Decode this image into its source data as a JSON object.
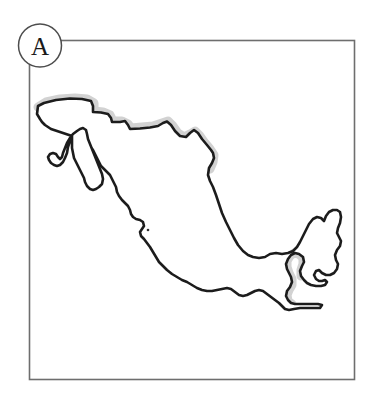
{
  "figure": {
    "panel_label": "A",
    "background_color": "#ffffff"
  },
  "frame": {
    "name": "panel-border-rectangle",
    "x": 29.5,
    "y": 40.5,
    "width": 325,
    "height": 339,
    "stroke_color": "#6e6e6e",
    "stroke_width": 1.6,
    "fill": "none"
  },
  "panel_label_badge": {
    "letter": "A",
    "center_x": 40,
    "center_y": 45.5,
    "radius": 21.5,
    "stroke_color": "#4d4d4d",
    "stroke_width": 1.5,
    "fill": "#ffffff",
    "text_color": "#1a1a1a"
  },
  "map": {
    "outline_color": "#1c1c1c",
    "outline_width": 2.6,
    "fill": "#ffffff",
    "highlight_color": "#d2d2d2",
    "highlight_width": 9,
    "country_outline_path": "M 37 114 L 38 106 L 47 103 L 60 100 L 74 99 L 86 100 L 94 104 L 94 112 L 101 113 L 106 114 L 110 116 L 112 122 L 119 122 L 124 121 L 127 124 L 129 129 L 136 129 L 145 128 L 152 127 L 159 126 L 164 123 L 168 122 L 172 126 L 176 132 L 180 136 L 186 137 L 190 134 L 193 130 L 197 131 L 200 136 L 204 141 L 209 147 L 213 150 L 206 156 L 203 163 L 203 171 L 206 176 L 209 179 L 211 185 L 213 189 L 216 185 L 218 179 L 217 172 L 214 167 L 214 160 L 217 155 L 220 147 L 220 139 L 219 133 L 222 129 L 227 127 L 232 128 L 237 128 L 241 128 L 245 128 L 245 126 L 240 125 L 234 125 L 229 124 L 226 126 L 222 126 L 219 129 L 214 134 L 210 139 L 207 143",
    "mainland_path": "M 37 114 L 38 106 L 44 103 L 56 100 L 70 98.5 L 82 99 L 91 101 L 93 106 L 93 112 L 101 112.5 L 108 114 L 111 118 L 112 122 L 120 122 L 125 121 L 128 125 L 130 129 L 140 128.5 L 150 127.5 L 158 126 L 163 123 L 167 121.5 L 171 125 L 175 131 L 180 136 L 186 137 L 190 133 L 194 130 L 198 133 L 202 139 L 207 145 L 211 150 L 213 153 L 214 158 L 212 163 L 209 168 L 208 175 L 210 181 L 213 187 L 216 195 L 219 204 L 222 213 L 226 222 L 230 230 L 234 238 L 238 245 L 243 251 L 248 255 L 253 257 L 259 258 L 265 257 L 270 254 L 276 253 L 282 254 L 288 253 L 293 251 L 297 247 L 300 242 L 303 236 L 306 230 L 309 224 L 313 219 L 317 217 L 321 218 L 324 221 L 326 216 L 329 212 L 333 210 L 337 210 L 340 212 L 341 217 L 340 223 L 338 228 L 337 233 L 339 237 L 341 241 L 340 246 L 337 250 L 335 255 L 336 260 L 338 264 L 337 269 L 334 273 L 330 275 L 326 275 L 322 273 L 319 270 L 316 271 L 314 275 L 316 279 L 319 281 L 322 281 L 325 280 L 327 282 L 325 285 L 321 286 L 316 286 L 311 285 L 307 283 L 304 280 L 301 276 L 300 271 L 302 266 L 304 262 L 303 257 L 299 254 L 295 253 L 291 255 L 288 259 L 286 264 L 287 269 L 289 273 L 291 277 L 292 282 L 290 287 L 287 291 L 286 296 L 288 300 L 291 303 L 295 304 L 300 304 L 306 304 L 312 304 L 318 304 L 322 305 L 320 308 L 314 308 L 307 308 L 300 308 L 294 309 L 289 310 L 285 309 L 282 306 L 279 303 L 275 300 L 271 297 L 267 294 L 263 291 L 259 290 L 255 291 L 251 293 L 247 295 L 243 296 L 239 295 L 235 292 L 231 289 L 227 288 L 222 289 L 217 290 L 212 291 L 207 291 L 202 290 L 197 288 L 192 285 L 187 282 L 182 280 L 177 277 L 172 274 L 167 270 L 163 266 L 159 262 L 156 257 L 153 252 L 150 247 L 147 243 L 144 239 L 141 236 L 140 232 L 142 229 L 144 226 L 143 222 L 140 220 L 136 219 L 133 217 L 131 214 L 130 210 L 128 206 L 125 203 L 122 200 L 119 196 L 117 192 L 116 187 L 114 183 L 112 179 L 110 175 L 107 172 L 104 169 L 101 166 L 99 162 L 97 158 L 95 154 L 93 150 L 90 147 L 87 145 L 84 143 L 81 141 L 78 139 L 75 137 L 72 136 L 69 135 L 66 134 L 63 133 L 60 132 L 57 131 L 54 130 L 51 129 L 48 127 L 45 125 L 42 122 L 40 119 Z",
    "baja_path": "M 72 136 L 70 141 L 68 147 L 67 153 L 65 158 L 63 162 L 60 165 L 57 166 L 54 165 L 51 163 L 49 160 L 48 157 L 50 154 L 53 153 L 56 154 L 58 157 L 60 159 L 62 157 L 63 153 L 65 148 L 67 143 L 70 138 L 73 134 L 77 131 L 80 129 L 83 128 L 86 130 L 87 134 L 88 139 L 90 144 L 92 149 L 94 154 L 96 159 L 98 164 L 100 169 L 102 174 L 103 179 L 102 184 L 99 187 L 96 189 L 93 190 L 90 189 L 87 186 L 85 182 L 84 178 L 82 174 L 80 170 L 78 166 L 76 162 L 74 158 L 73 153 L 72 148 L 72 142 Z",
    "city_dot": {
      "x": 148,
      "y": 230,
      "radius": 1.3,
      "color": "#303030"
    },
    "highlight_segments": [
      {
        "name": "northern-border-highlight",
        "description": "Shading along the Mexico-United States border",
        "path": "M 38 107 L 46 102 L 60 99 L 75 98 L 87 99 L 94 103 L 94 111 L 103 112 L 110 115 L 113 121 L 122 121 L 128 124 L 131 128 L 142 127 L 153 126 L 162 123 L 168 121 L 173 126 L 178 133 L 184 137 L 190 134 L 195 131 L 200 136 L 205 143 L 210 149 L 214 155 L 213 162 L 210 169"
      },
      {
        "name": "southeast-border-highlight",
        "description": "Shading along the Belize and Guatemala border on the Yucatan Peninsula",
        "path": "M 301 276 L 301 270 L 303 264 L 303 258 L 299 254 L 294 253 L 290 256 L 287 261 L 287 267 L 289 273 L 292 279 L 292 285 L 289 290 L 287 295 L 288 301 L 292 304"
      }
    ]
  }
}
